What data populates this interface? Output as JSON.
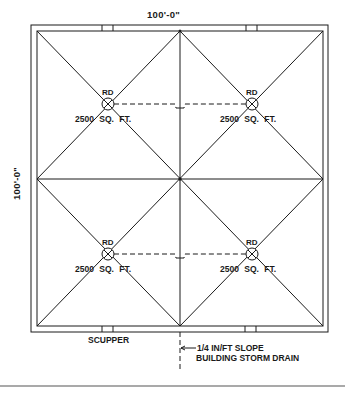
{
  "dimensions": {
    "width": "100'-0\"",
    "height": "100'-0\""
  },
  "drains": [
    {
      "label": "RD",
      "area": "2500 SQ. FT.",
      "position": "top-left"
    },
    {
      "label": "RD",
      "area": "2500 SQ. FT.",
      "position": "top-right"
    },
    {
      "label": "RD",
      "area": "2500 SQ. FT.",
      "position": "bottom-left"
    },
    {
      "label": "RD",
      "area": "2500 SQ. FT.",
      "position": "bottom-right"
    }
  ],
  "annotations": {
    "scupper": "SCUPPER",
    "slope": "1/4 IN/FT SLOPE",
    "storm_drain": "BUILDING STORM DRAIN"
  },
  "colors": {
    "line": "#1a1a1a",
    "background": "#ffffff",
    "rule": "#555555"
  }
}
